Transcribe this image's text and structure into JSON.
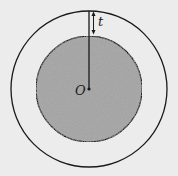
{
  "diagram": {
    "type": "concentric-sphere-shell",
    "labels": {
      "center": "O",
      "thickness": "t"
    },
    "colors": {
      "background": "#ececec",
      "stroke": "#1a1a1a",
      "core_fill": "#a9a9a9"
    },
    "geometry": {
      "center": [
        89,
        89
      ],
      "outer_radius": 78,
      "inner_radius": 53
    }
  }
}
